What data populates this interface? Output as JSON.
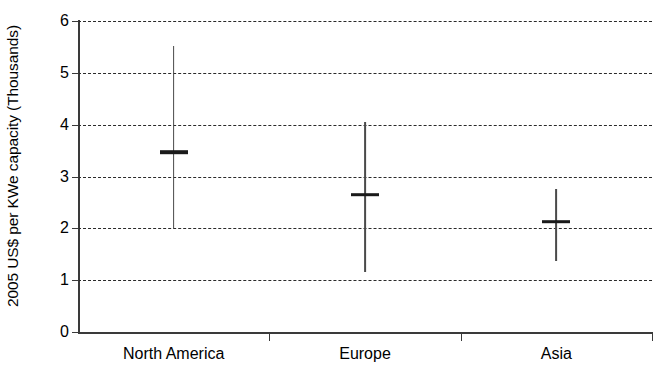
{
  "chart_data": {
    "type": "range",
    "title": "",
    "subtitle": "",
    "xlabel": "",
    "ylabel": "2005 US$ per KWe capacity (Thousands)",
    "categories": [
      "North America",
      "Europe",
      "Asia"
    ],
    "ylim": [
      0,
      6
    ],
    "y_ticks": [
      0,
      1,
      2,
      3,
      4,
      5,
      6
    ],
    "y_tick_labels": [
      "0",
      "1",
      "2",
      "3",
      "4",
      "5",
      "6"
    ],
    "grid": "horizontal-dashed",
    "legend": "none",
    "series": [
      {
        "name": "Cost range with central estimate",
        "points": [
          {
            "category": "North America",
            "low": 2.0,
            "high": 5.52,
            "mean": 3.47
          },
          {
            "category": "Europe",
            "low": 1.15,
            "high": 4.05,
            "mean": 2.65
          },
          {
            "category": "Asia",
            "low": 1.37,
            "high": 2.75,
            "mean": 2.13
          }
        ]
      }
    ],
    "annotations": []
  },
  "axes": {
    "y_title": "2005 US$ per KWe capacity (Thousands)",
    "y_labels": [
      "6",
      "5",
      "4",
      "3",
      "2",
      "1",
      "0"
    ],
    "x_labels": [
      "North America",
      "Europe",
      "Asia"
    ]
  },
  "style": {
    "axis_color": "#3a3a3a",
    "grid_color": "#2a2a2a",
    "marker_color": "#1a1a1a",
    "stem_color": "#4a4a4a",
    "background": "#ffffff"
  }
}
